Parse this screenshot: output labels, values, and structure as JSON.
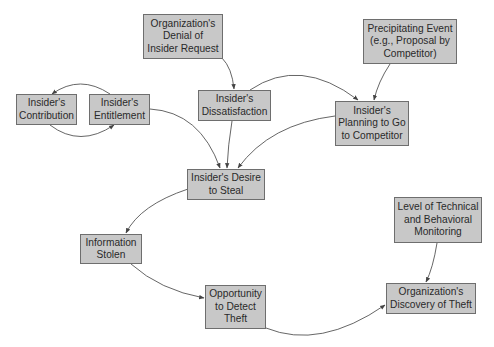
{
  "diagram": {
    "nodes": [
      {
        "id": "denial",
        "label": "Organization's\nDenial of\nInsider Request",
        "x": 143,
        "y": 14,
        "w": 80,
        "h": 45
      },
      {
        "id": "contribution",
        "label": "Insider's\nContribution",
        "x": 16,
        "y": 94,
        "w": 61,
        "h": 31
      },
      {
        "id": "entitlement",
        "label": "Insider's\nEntitlement",
        "x": 89,
        "y": 94,
        "w": 61,
        "h": 31
      },
      {
        "id": "dissatisfaction",
        "label": "Insider's\nDissatisfaction",
        "x": 198,
        "y": 90,
        "w": 73,
        "h": 31
      },
      {
        "id": "precipitating",
        "label": "Precipitating Event\n(e.g., Proposal by\nCompetitor)",
        "x": 363,
        "y": 19,
        "w": 94,
        "h": 45
      },
      {
        "id": "planning",
        "label": "Insider's\nPlanning to Go\nto Competitor",
        "x": 335,
        "y": 101,
        "w": 74,
        "h": 45
      },
      {
        "id": "desire",
        "label": "Insider's Desire\nto Steal",
        "x": 187,
        "y": 169,
        "w": 78,
        "h": 31
      },
      {
        "id": "stolen",
        "label": "Information\nStolen",
        "x": 80,
        "y": 234,
        "w": 62,
        "h": 30
      },
      {
        "id": "opportunity",
        "label": "Opportunity\nto Detect\nTheft",
        "x": 205,
        "y": 285,
        "w": 61,
        "h": 44
      },
      {
        "id": "monitoring",
        "label": "Level of Technical\nand Behavioral\nMonitoring",
        "x": 394,
        "y": 197,
        "w": 88,
        "h": 46
      },
      {
        "id": "discovery",
        "label": "Organization's\nDiscovery of Theft",
        "x": 386,
        "y": 283,
        "w": 90,
        "h": 31
      }
    ],
    "edges": [
      {
        "from": "entitlement",
        "to": "contribution",
        "path": "M110,94 Q80,74 52,94"
      },
      {
        "from": "contribution",
        "to": "entitlement",
        "path": "M50,125 Q80,148 114,125"
      },
      {
        "from": "denial",
        "to": "dissatisfaction",
        "path": "M222,58 Q232,68 234,89"
      },
      {
        "from": "dissatisfaction",
        "to": "planning",
        "path": "M250,90 Q300,56 358,100"
      },
      {
        "from": "precipitating",
        "to": "planning",
        "path": "M390,64 Q378,82 374,100"
      },
      {
        "from": "entitlement",
        "to": "desire",
        "path": "M150,109 Q200,112 220,168"
      },
      {
        "from": "dissatisfaction",
        "to": "desire",
        "path": "M232,121 Q228,145 227,168"
      },
      {
        "from": "planning",
        "to": "desire",
        "path": "M335,116 Q270,124 238,168"
      },
      {
        "from": "desire",
        "to": "stolen",
        "path": "M188,189 Q140,205 126,233"
      },
      {
        "from": "stolen",
        "to": "opportunity",
        "path": "M131,264 Q160,290 204,298"
      },
      {
        "from": "monitoring",
        "to": "discovery",
        "path": "M437,243 Q433,268 426,282"
      },
      {
        "from": "opportunity",
        "to": "discovery",
        "path": "M266,328 Q320,350 385,305"
      }
    ],
    "colors": {
      "node_fill": "#c8c8c8",
      "node_border": "#6e6e6e",
      "edge": "#555555",
      "text": "#2a2a2a"
    }
  }
}
